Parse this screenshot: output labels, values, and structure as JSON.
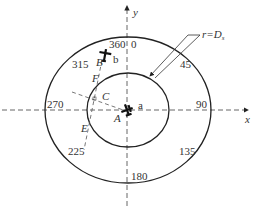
{
  "axes": {
    "x_label": "x",
    "y_label": "y"
  },
  "bearings": {
    "b0": "0",
    "b360": "360",
    "b45": "45",
    "b90": "90",
    "b135": "135",
    "b180": "180",
    "b225": "225",
    "b270": "270",
    "b315": "315"
  },
  "points": {
    "A": "A",
    "B": "B",
    "C": "C",
    "E": "E",
    "F": "F"
  },
  "aircraft": {
    "a": "a",
    "b": "b"
  },
  "annotation": {
    "radius_label": "r=D",
    "radius_sub": "s"
  },
  "colors": {
    "stroke": "#222222",
    "dash": "#555555"
  }
}
